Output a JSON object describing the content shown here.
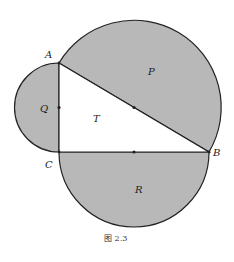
{
  "figure": {
    "caption": "图 2.3",
    "fill_color": "#b8b8b8",
    "stroke_color": "#222222",
    "points": {
      "A": {
        "label": "A",
        "x": 59,
        "y": 63
      },
      "B": {
        "label": "B",
        "x": 209,
        "y": 152
      },
      "C": {
        "label": "C",
        "x": 59,
        "y": 152
      }
    },
    "regions": {
      "P": {
        "label": "P"
      },
      "Q": {
        "label": "Q"
      },
      "R": {
        "label": "R"
      },
      "T": {
        "label": "T"
      }
    }
  }
}
